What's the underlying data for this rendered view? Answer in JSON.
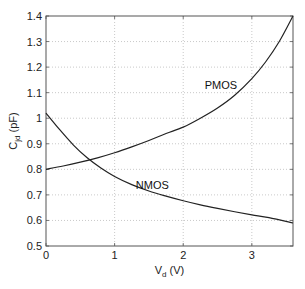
{
  "chart_data": {
    "type": "line",
    "title": "",
    "xlabel": "V_d (V)",
    "xlabel_main": "V",
    "xlabel_sub": "d",
    "xlabel_unit": " (V)",
    "ylabel": "C_jd (pF)",
    "ylabel_main": "C",
    "ylabel_sub": "jd",
    "ylabel_unit": " (pF)",
    "xlim": [
      0,
      3.6
    ],
    "ylim": [
      0.5,
      1.4
    ],
    "xticks": [
      0,
      1,
      2,
      3
    ],
    "xtick_labels": [
      "0",
      "1",
      "2",
      "3"
    ],
    "yticks": [
      0.5,
      0.6,
      0.7,
      0.8,
      0.9,
      1.0,
      1.1,
      1.2,
      1.3,
      1.4
    ],
    "ytick_labels": [
      "0.5",
      "0.6",
      "0.7",
      "0.8",
      "0.9",
      "1",
      "1.1",
      "1.2",
      "1.3",
      "1.4"
    ],
    "grid": true,
    "legend": "none (inline curve labels)",
    "series": [
      {
        "name": "NMOS",
        "label_pos": [
          1.55,
          0.725
        ],
        "x": [
          0,
          0.2,
          0.4,
          0.6,
          0.8,
          1.0,
          1.25,
          1.5,
          1.75,
          2.0,
          2.25,
          2.5,
          2.75,
          3.0,
          3.25,
          3.6
        ],
        "values": [
          1.02,
          0.955,
          0.895,
          0.845,
          0.805,
          0.772,
          0.74,
          0.715,
          0.695,
          0.677,
          0.661,
          0.647,
          0.634,
          0.622,
          0.611,
          0.59
        ]
      },
      {
        "name": "PMOS",
        "label_pos": [
          2.55,
          1.115
        ],
        "x": [
          0,
          0.25,
          0.5,
          0.75,
          1.0,
          1.25,
          1.5,
          1.75,
          2.0,
          2.25,
          2.5,
          2.75,
          3.0,
          3.2,
          3.4,
          3.6
        ],
        "values": [
          0.8,
          0.813,
          0.828,
          0.845,
          0.865,
          0.888,
          0.913,
          0.94,
          0.965,
          1.0,
          1.04,
          1.09,
          1.155,
          1.22,
          1.3,
          1.4
        ]
      }
    ]
  },
  "colors": {
    "curve": "#222222",
    "axis": "#555555",
    "grid": "#bbbbbb"
  }
}
